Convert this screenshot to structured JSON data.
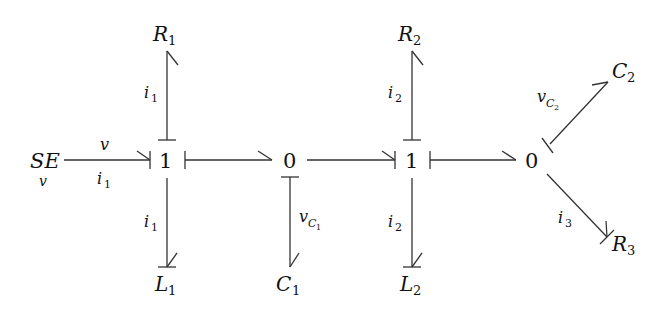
{
  "diagram": {
    "type": "bond-graph",
    "nodes": {
      "se": {
        "label": "SE",
        "sub_below": "v"
      },
      "j1a": {
        "label": "1"
      },
      "j0a": {
        "label": "0"
      },
      "j1b": {
        "label": "1"
      },
      "j0b": {
        "label": "0"
      },
      "r1": {
        "label": "R",
        "sub": "1"
      },
      "l1": {
        "label": "L",
        "sub": "1"
      },
      "c1": {
        "label": "C",
        "sub": "1"
      },
      "r2": {
        "label": "R",
        "sub": "2"
      },
      "l2": {
        "label": "L",
        "sub": "2"
      },
      "c2": {
        "label": "C",
        "sub": "2"
      },
      "r3": {
        "label": "R",
        "sub": "3"
      }
    },
    "bonds": {
      "se_1a": {
        "effort": "v",
        "flow": "i",
        "flow_sub": "1"
      },
      "1a_r1": {
        "flow": "i",
        "flow_sub": "1"
      },
      "1a_l1": {
        "flow": "i",
        "flow_sub": "1"
      },
      "0a_c1": {
        "effort": "v",
        "effort_sub": "C",
        "effort_subsub": "1"
      },
      "1b_r2": {
        "flow": "i",
        "flow_sub": "2"
      },
      "1b_l2": {
        "flow": "i",
        "flow_sub": "2"
      },
      "0b_c2": {
        "effort": "v",
        "effort_sub": "C",
        "effort_subsub": "2"
      },
      "0b_r3": {
        "flow": "i",
        "flow_sub": "3"
      }
    },
    "connections": [
      [
        "SE",
        "1"
      ],
      [
        "1",
        "R1"
      ],
      [
        "1",
        "L1"
      ],
      [
        "1",
        "0"
      ],
      [
        "0",
        "C1"
      ],
      [
        "0",
        "1"
      ],
      [
        "1",
        "R2"
      ],
      [
        "1",
        "L2"
      ],
      [
        "1",
        "0"
      ],
      [
        "0",
        "C2"
      ],
      [
        "0",
        "R3"
      ]
    ]
  }
}
